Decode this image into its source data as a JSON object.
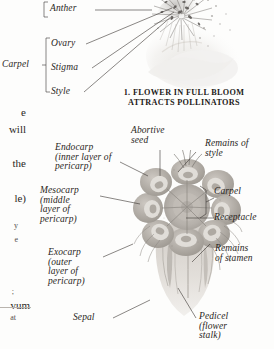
{
  "page": {
    "background": "#fdfdfc",
    "ink": "#2a2623"
  },
  "figure_1": {
    "caption_line_1": "1. FLOWER IN FULL BLOOM",
    "caption_line_2": "ATTRACTS POLLINATORS",
    "labels": {
      "anther": "Anther",
      "carpel": "Carpel",
      "ovary": "Ovary",
      "stigma": "Stigma",
      "style": "Style"
    }
  },
  "figure_2": {
    "labels": {
      "abortive_seed": "Abortive\nseed",
      "endocarp": "Endocarp\n(inner layer of\npericarp)",
      "mesocarp": "Mesocarp\n(middle\nlayer of\npericarp)",
      "exocarp": "Exocarp\n(outer\nlayer of\npericarp)",
      "sepal": "Sepal",
      "remains_of_style": "Remains of\nstyle",
      "carpel": "Carpel",
      "receptacle": "Receptacle",
      "remains_of_stamen": "Remains\nof stamen",
      "pedicel": "Pedicel\n(flower\nstalk)"
    }
  },
  "column_bleed": {
    "line_1": "e",
    "line_2": "will",
    "line_3": "the",
    "line_4": "le)",
    "line_5": "y",
    "line_6": "e",
    "line_7": ";",
    "line_8": "vum",
    "line_9": "at"
  }
}
